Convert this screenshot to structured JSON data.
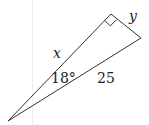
{
  "diagram": {
    "type": "right-triangle",
    "labels": {
      "leg_opposite": "y",
      "leg_adjacent": "x",
      "hypotenuse": "25",
      "angle": "18°"
    },
    "right_angle_marker": true,
    "colors": {
      "stroke": "#333333",
      "background": "#ffffff",
      "guide": "#eeeeee"
    }
  }
}
